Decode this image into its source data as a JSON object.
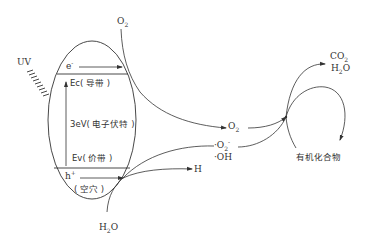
{
  "diagram": {
    "type": "photocatalysis-mechanism",
    "colors": {
      "stroke": "#333333",
      "text": "#333333",
      "background": "#ffffff"
    },
    "light_source": {
      "label": "UV"
    },
    "semiconductor": {
      "electron": {
        "symbol": "e",
        "charge": "-"
      },
      "conduction_band": {
        "label": "Ec( 导带 )"
      },
      "band_gap": {
        "label": "3eV( 电子伏特 )"
      },
      "valence_band": {
        "label": "Ev( 价带 )"
      },
      "hole": {
        "symbol": "h",
        "charge": "+",
        "label": "( 空穴 )"
      }
    },
    "species": {
      "o2_top": {
        "base": "O",
        "sub": "2"
      },
      "h2o_bottom": {
        "base1": "H",
        "sub": "2",
        "base2": "O"
      },
      "o2_middle": {
        "base": "O",
        "sub": "2"
      },
      "superoxide": {
        "prefix": "·O",
        "sub": "2",
        "sup": "-"
      },
      "hydroxyl": {
        "text": "·OH"
      },
      "hydrogen": {
        "text": "H"
      },
      "co2": {
        "base": "CO",
        "sub": "2"
      },
      "h2o_product": {
        "base1": "H",
        "sub": "2",
        "base2": "O"
      },
      "organic": {
        "text": "有机化合物"
      }
    }
  }
}
